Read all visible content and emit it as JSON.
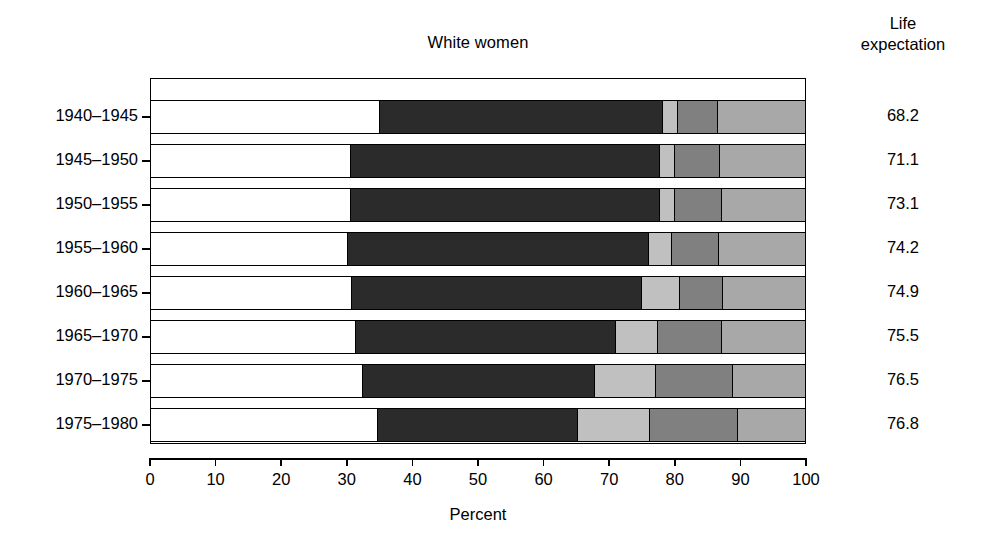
{
  "chart_data": {
    "type": "bar",
    "subtype": "stacked-horizontal-100",
    "title": "White women",
    "xlabel": "Percent",
    "ylabel": "",
    "xlim": [
      0,
      100
    ],
    "xticks": [
      0,
      10,
      20,
      30,
      40,
      50,
      60,
      70,
      80,
      90,
      100
    ],
    "xticklabels": [
      "0",
      "10",
      "20",
      "30",
      "40",
      "50",
      "60",
      "70",
      "80",
      "90",
      "100"
    ],
    "grid": false,
    "legend": "none",
    "categories": [
      "1940–1945",
      "1945–1950",
      "1950–1955",
      "1955–1960",
      "1960–1965",
      "1965–1970",
      "1970–1975",
      "1975–1980"
    ],
    "series": [
      {
        "name": "segment-1",
        "color": "#ffffff",
        "values": [
          34.8,
          30.5,
          30.5,
          30.0,
          30.6,
          31.2,
          32.3,
          34.6
        ]
      },
      {
        "name": "segment-2",
        "color": "#2b2b2b",
        "values": [
          43.4,
          47.2,
          47.1,
          46.0,
          44.4,
          39.7,
          35.4,
          30.6
        ]
      },
      {
        "name": "segment-3",
        "color": "#c0c0c0",
        "values": [
          2.3,
          2.3,
          2.4,
          3.5,
          5.8,
          6.5,
          9.4,
          11.0
        ]
      },
      {
        "name": "segment-4",
        "color": "#808080",
        "values": [
          6.1,
          6.9,
          7.2,
          7.2,
          6.5,
          9.8,
          11.8,
          13.4
        ]
      },
      {
        "name": "segment-5",
        "color": "#a8a8a8",
        "values": [
          13.4,
          13.1,
          12.8,
          13.3,
          12.7,
          12.8,
          11.1,
          10.4
        ]
      }
    ],
    "annotations": {
      "right_column_header": "Life expectation",
      "right_column_values": [
        "68.2",
        "71.1",
        "73.1",
        "74.2",
        "74.9",
        "75.5",
        "76.5",
        "76.8"
      ]
    }
  },
  "axis": {
    "x_title": "Percent"
  },
  "right_panel": {
    "header_line1": "Life",
    "header_line2": "expectation"
  }
}
